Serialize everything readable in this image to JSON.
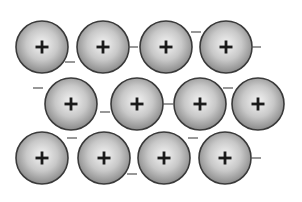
{
  "diagram": {
    "ion_symbol": "+",
    "electron_symbol": "−",
    "ion_radius": 26,
    "colors": {
      "ion_center": "#f2f2f2",
      "ion_edge": "#8a8a8a",
      "ion_outline": "#3a3a3a",
      "symbol": "#1a1a1a",
      "electron": "#555555",
      "background": "#ffffff"
    },
    "ions": [
      {
        "row": 1,
        "cx": 42,
        "cy": 47
      },
      {
        "row": 1,
        "cx": 103,
        "cy": 47
      },
      {
        "row": 1,
        "cx": 166,
        "cy": 47
      },
      {
        "row": 1,
        "cx": 226,
        "cy": 47
      },
      {
        "row": 2,
        "cx": 71,
        "cy": 104
      },
      {
        "row": 2,
        "cx": 137,
        "cy": 104
      },
      {
        "row": 2,
        "cx": 200,
        "cy": 104
      },
      {
        "row": 2,
        "cx": 258,
        "cy": 104
      },
      {
        "row": 3,
        "cx": 42,
        "cy": 158
      },
      {
        "row": 3,
        "cx": 104,
        "cy": 158
      },
      {
        "row": 3,
        "cx": 164,
        "cy": 158
      },
      {
        "row": 3,
        "cx": 225,
        "cy": 158
      }
    ],
    "electrons": [
      {
        "x": 70,
        "y": 62
      },
      {
        "x": 133,
        "y": 47
      },
      {
        "x": 196,
        "y": 32
      },
      {
        "x": 256,
        "y": 47
      },
      {
        "x": 38,
        "y": 88
      },
      {
        "x": 105,
        "y": 112
      },
      {
        "x": 168,
        "y": 104
      },
      {
        "x": 228,
        "y": 88
      },
      {
        "x": 72,
        "y": 138
      },
      {
        "x": 132,
        "y": 174
      },
      {
        "x": 193,
        "y": 138
      },
      {
        "x": 256,
        "y": 158
      }
    ]
  }
}
